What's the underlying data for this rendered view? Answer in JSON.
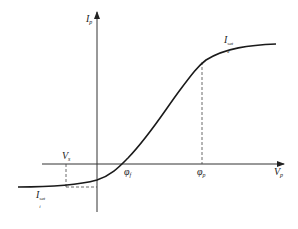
{
  "figure": {
    "axes": {
      "y_label": {
        "main": "I",
        "sub": "p"
      },
      "x_label": {
        "main": "V",
        "sub": "p"
      }
    },
    "labels": {
      "electron_saturation": {
        "main": "I",
        "sup": "sat",
        "sub": "e"
      },
      "ion_saturation": {
        "main": "I",
        "sup": "sat",
        "sub": "i"
      },
      "vs": {
        "main": "V",
        "sub": "s"
      },
      "floating_potential": {
        "main": "φ",
        "sub": "f"
      },
      "plasma_potential": {
        "main": "φ",
        "sub": "p"
      }
    },
    "colors": {
      "curve": "#1a1a1a",
      "axes": "#333333",
      "dashed": "#444444"
    }
  }
}
